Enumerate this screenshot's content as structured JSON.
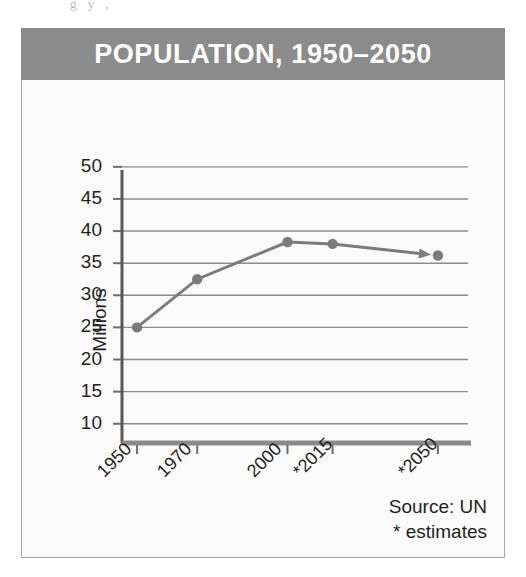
{
  "scan_artifact": "g  y        ,",
  "figure": {
    "title": "POPULATION, 1950–2050",
    "source_line1": "Source: UN",
    "source_line2": "* estimates",
    "colors": {
      "title_band": "#8b8b8b",
      "title_text": "#ffffff",
      "series": "#7b7b7b",
      "axis": "#6e6e6e",
      "grid": "#8c8c8c",
      "panel": "#fbfbfb",
      "text": "#231f20"
    }
  },
  "chart_data": {
    "type": "line",
    "title": "POPULATION, 1950–2050",
    "xlabel": "",
    "ylabel": "Millions",
    "categories": [
      "1950",
      "1970",
      "2000",
      "*2015",
      "*2050"
    ],
    "x_tick_labels": [
      "1950",
      "1970",
      "2000",
      "*2015",
      "*2050"
    ],
    "x_values": [
      1950,
      1970,
      2000,
      2015,
      2050
    ],
    "values": [
      25.0,
      32.5,
      38.3,
      38.0,
      36.2
    ],
    "series": [
      {
        "name": "Population",
        "values": [
          25.0,
          32.5,
          38.3,
          38.0,
          36.2
        ]
      }
    ],
    "ylim": [
      7,
      52
    ],
    "xlim": [
      1945,
      2060
    ],
    "y_ticks": [
      50,
      45,
      40,
      35,
      30,
      25,
      20,
      15,
      10
    ],
    "y_tick_labels": [
      "50",
      "45",
      "40",
      "35",
      "30",
      "25",
      "20",
      "15",
      "10"
    ],
    "grid": "horizontal",
    "legend": "none",
    "markers": true,
    "arrow_at_end": true,
    "annotations": [
      "Source: UN",
      "* estimates"
    ],
    "units": "Millions"
  }
}
